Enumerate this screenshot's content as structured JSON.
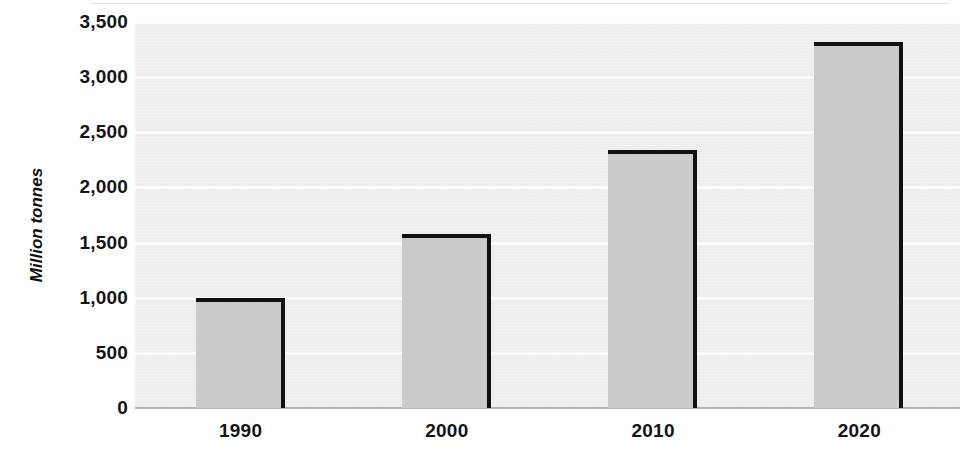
{
  "chart_data": {
    "type": "bar",
    "title": "",
    "xlabel": "",
    "ylabel": "Million tonnes",
    "categories": [
      "1990",
      "2000",
      "2010",
      "2020"
    ],
    "values": [
      1000,
      1580,
      2340,
      3320
    ],
    "ylim": [
      0,
      3500
    ],
    "ytick_values": [
      0,
      500,
      1000,
      1500,
      2000,
      2500,
      3000,
      3500
    ],
    "ytick_labels": [
      "0",
      "500",
      "1,000",
      "1,500",
      "2,000",
      "2,500",
      "3,000",
      "3,500"
    ],
    "grid": true,
    "legend": false,
    "legend_position": "none",
    "series": [
      {
        "name": "Million tonnes",
        "values": [
          1000,
          1580,
          2340,
          3320
        ]
      }
    ],
    "colors": {
      "bar_fill": "#cbcbcb",
      "bar_outline": "#111111",
      "plot_background": "#ededed",
      "gridline": "#fbfbfb",
      "axis_line": "#b3b3b3",
      "text": "#141414"
    }
  }
}
